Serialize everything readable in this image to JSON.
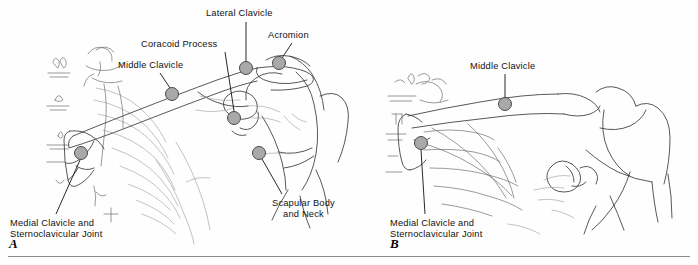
{
  "figure": {
    "background_color": "#fefefe",
    "marker_fill": "#a9a9a9",
    "marker_stroke": "#4a4a4a",
    "line_color": "#3a3a3a"
  },
  "panels": [
    {
      "letter": "A",
      "letter_x": 9,
      "letter_y": 236,
      "view": "anterior",
      "labels": [
        {
          "id": "lateral-clavicle",
          "text": "Lateral Clavicle",
          "text_x": 206,
          "text_y": 8,
          "leader": {
            "x1": 246,
            "y1": 22,
            "x2": 246,
            "y2": 62
          },
          "marker": {
            "cx": 246,
            "cy": 68,
            "r": 6.5
          }
        },
        {
          "id": "acromion",
          "text": "Acromion",
          "text_x": 268,
          "text_y": 30,
          "leader": {
            "x1": 292,
            "y1": 43,
            "x2": 282,
            "y2": 58
          },
          "marker": {
            "cx": 279,
            "cy": 63,
            "r": 6.5
          }
        },
        {
          "id": "coracoid-process",
          "text": "Coracoid Process",
          "text_x": 141,
          "text_y": 39,
          "leader": {
            "x1": 225,
            "y1": 52,
            "x2": 234,
            "y2": 111
          },
          "marker": {
            "cx": 234,
            "cy": 118,
            "r": 6.5
          }
        },
        {
          "id": "middle-clavicle",
          "text": "Middle Clavicle",
          "text_x": 118,
          "text_y": 60,
          "leader": {
            "x1": 160,
            "y1": 73,
            "x2": 170,
            "y2": 88
          },
          "marker": {
            "cx": 172,
            "cy": 94,
            "r": 6.5
          }
        },
        {
          "id": "scapular-body-and-neck",
          "text": "Scapular Body\nand Neck",
          "text_x": 272,
          "text_y": 198,
          "leader": {
            "x1": 262,
            "y1": 159,
            "x2": 282,
            "y2": 194
          },
          "marker": {
            "cx": 259,
            "cy": 153,
            "r": 6.5
          }
        },
        {
          "id": "medial-clavicle-sternoclavicular-joint",
          "text": "Medial Clavicle and\nSternoclavicular Joint",
          "text_x": 10,
          "text_y": 218,
          "leader": {
            "x1": 80,
            "y1": 160,
            "x2": 56,
            "y2": 214
          },
          "marker": {
            "cx": 81,
            "cy": 153,
            "r": 6.5
          }
        }
      ]
    },
    {
      "letter": "B",
      "letter_x": 390,
      "letter_y": 236,
      "view": "posterior",
      "labels": [
        {
          "id": "middle-clavicle-b",
          "text": "Middle Clavicle",
          "text_x": 470,
          "text_y": 61,
          "leader": {
            "x1": 505,
            "y1": 74,
            "x2": 505,
            "y2": 98
          },
          "marker": {
            "cx": 505,
            "cy": 104,
            "r": 6.5
          }
        },
        {
          "id": "medial-clavicle-sternoclavicular-joint-b",
          "text": "Medial Clavicle and\nSternoclavicular Joint",
          "text_x": 390,
          "text_y": 218,
          "leader": {
            "x1": 421,
            "y1": 150,
            "x2": 425,
            "y2": 214
          },
          "marker": {
            "cx": 421,
            "cy": 143,
            "r": 6.5
          }
        }
      ]
    }
  ],
  "divider": {
    "x": 8,
    "y": 256,
    "width": 682
  }
}
